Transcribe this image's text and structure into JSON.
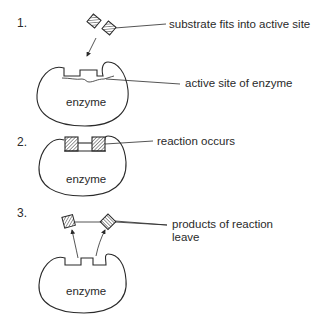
{
  "steps": [
    {
      "number": "1.",
      "labels": [
        "substrate fits into active site",
        "active site of enzyme"
      ],
      "enzyme_label": "enzyme"
    },
    {
      "number": "2.",
      "labels": [
        "reaction occurs"
      ],
      "enzyme_label": "enzyme"
    },
    {
      "number": "3.",
      "labels": [
        "products of reaction",
        "leave"
      ],
      "enzyme_label": "enzyme"
    }
  ],
  "colors": {
    "ink": "#2a2a2a",
    "hatch_fill": "#9a9a9a",
    "background": "#ffffff"
  }
}
